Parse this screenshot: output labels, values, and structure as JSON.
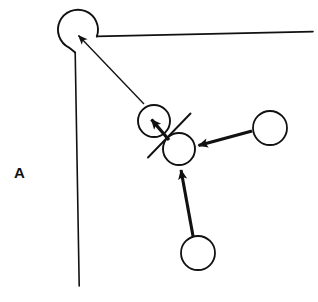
{
  "figure": {
    "panel_label": "A",
    "panel_label_position": {
      "x": 14,
      "y": 165
    },
    "canvas": {
      "width": 318,
      "height": 302,
      "background": "#ffffff"
    },
    "stroke_color": "#111111",
    "fill_color": "none",
    "caption_text": "",
    "elements": {
      "corner_circle": {
        "name": "corner-circle-notched",
        "cx": 78,
        "cy": 30,
        "r": 20,
        "description": "open circle at corner with notch where boundary lines attach"
      },
      "boundary_top_line": {
        "name": "boundary-top",
        "x1": 97,
        "y1": 36,
        "x2": 313,
        "y2": 32
      },
      "boundary_left_line": {
        "name": "boundary-left",
        "x1": 75,
        "y1": 52,
        "x2": 79,
        "y2": 286
      },
      "circles": [
        {
          "id": "circle-upper-pair",
          "cx": 154,
          "cy": 121,
          "r": 16
        },
        {
          "id": "circle-lower-pair",
          "cx": 179,
          "cy": 149,
          "r": 16
        },
        {
          "id": "circle-right",
          "cx": 270,
          "cy": 128,
          "r": 17
        },
        {
          "id": "circle-bottom",
          "cx": 198,
          "cy": 253,
          "r": 17
        }
      ],
      "slash_line": {
        "name": "diagonal-slash",
        "x1": 148,
        "y1": 157,
        "x2": 190,
        "y2": 114
      },
      "arrows": [
        {
          "id": "arrow-to-corner-circle",
          "from": {
            "x": 144,
            "y": 104
          },
          "to": {
            "x": 76,
            "y": 33
          },
          "head_size": 11,
          "shaft_width": 1.3
        },
        {
          "id": "arrow-to-upper-pair-circle",
          "from": {
            "x": 168,
            "y": 139
          },
          "to": {
            "x": 150,
            "y": 118
          },
          "head_size": 10,
          "shaft_width": 3.2
        },
        {
          "id": "arrow-right-to-lower-pair",
          "from": {
            "x": 252,
            "y": 131
          },
          "to": {
            "x": 196,
            "y": 146
          },
          "head_size": 11,
          "shaft_width": 3.2
        },
        {
          "id": "arrow-bottom-to-lower-pair",
          "from": {
            "x": 193,
            "y": 236
          },
          "to": {
            "x": 180,
            "y": 168
          },
          "head_size": 11,
          "shaft_width": 3.0
        }
      ]
    }
  }
}
